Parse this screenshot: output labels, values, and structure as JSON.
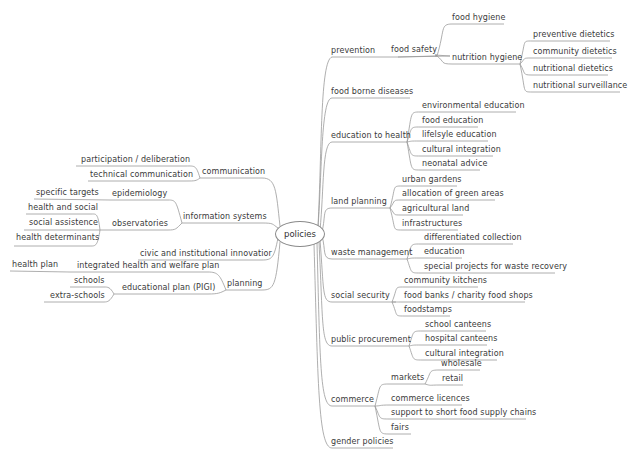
{
  "root": {
    "label": "policies"
  },
  "right_branches": [
    {
      "label": "prevention",
      "children": [
        {
          "label": "food safety",
          "children": [
            {
              "label": "food hygiene"
            },
            {
              "label": "nutrition hygiene",
              "children": [
                {
                  "label": "preventive dietetics"
                },
                {
                  "label": "community dietetics"
                },
                {
                  "label": "nutritional dietetics"
                },
                {
                  "label": "nutritional surveillance"
                }
              ]
            }
          ]
        }
      ]
    },
    {
      "label": "food borne diseases"
    },
    {
      "label": "education to health",
      "children": [
        {
          "label": "environmental education"
        },
        {
          "label": "food education"
        },
        {
          "label": "lifelsyle education"
        },
        {
          "label": "cultural integration"
        },
        {
          "label": "neonatal advice"
        }
      ]
    },
    {
      "label": "land planning",
      "children": [
        {
          "label": "urban gardens"
        },
        {
          "label": "allocation of green areas"
        },
        {
          "label": "agricultural land"
        },
        {
          "label": "infrastructures"
        }
      ]
    },
    {
      "label": "waste management",
      "children": [
        {
          "label": "differentiated collection"
        },
        {
          "label": "education"
        },
        {
          "label": "special projects for waste recovery"
        }
      ]
    },
    {
      "label": "social security",
      "children": [
        {
          "label": "community kitchens"
        },
        {
          "label": "food banks / charity food shops"
        },
        {
          "label": "foodstamps"
        }
      ]
    },
    {
      "label": "public procurement",
      "children": [
        {
          "label": "school canteens"
        },
        {
          "label": "hospital canteens"
        },
        {
          "label": "cultural integration"
        }
      ]
    },
    {
      "label": "commerce",
      "children": [
        {
          "label": "markets",
          "children": [
            {
              "label": "wholesale"
            },
            {
              "label": "retail"
            }
          ]
        },
        {
          "label": "commerce licences"
        },
        {
          "label": "support to short food supply chains"
        },
        {
          "label": "fairs"
        }
      ]
    },
    {
      "label": "gender policies"
    }
  ],
  "left_branches": [
    {
      "label": "communication",
      "children": [
        {
          "label": "participation / deliberation"
        },
        {
          "label": "technical communication"
        }
      ]
    },
    {
      "label": "information systems",
      "children": [
        {
          "label": "epidemiology",
          "children": [
            {
              "label": "specific targets"
            }
          ]
        },
        {
          "label": "observatories",
          "children": [
            {
              "label": "health and social"
            },
            {
              "label": "social assistence"
            },
            {
              "label": "health determinants"
            }
          ]
        }
      ]
    },
    {
      "label": "civic and institutional innovatior"
    },
    {
      "label": "planning",
      "children": [
        {
          "label": "integrated health and welfare plan",
          "children": [
            {
              "label": "health plan"
            }
          ]
        },
        {
          "label": "educational plan (PIGI)",
          "children": [
            {
              "label": "schools"
            },
            {
              "label": "extra-schools"
            }
          ]
        }
      ]
    }
  ],
  "colors": {
    "line": "#9a9a9a",
    "text": "#3a3a3a",
    "background": "#ffffff"
  }
}
